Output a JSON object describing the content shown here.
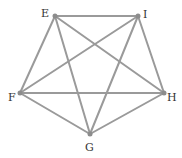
{
  "diagram": {
    "type": "complete-graph",
    "name": "K5",
    "colors": {
      "edge": "#9a9a9a",
      "vertex": "#8c8c8c",
      "label": "#333333",
      "background": "#ffffff"
    },
    "vertices": [
      {
        "id": "E",
        "label": "E",
        "x": 55,
        "y": 16,
        "lx": 41,
        "ly": 17
      },
      {
        "id": "I",
        "label": "I",
        "x": 138,
        "y": 16,
        "lx": 143,
        "ly": 18
      },
      {
        "id": "F",
        "label": "F",
        "x": 20,
        "y": 93,
        "lx": 8,
        "ly": 101
      },
      {
        "id": "H",
        "label": "H",
        "x": 164,
        "y": 93,
        "lx": 167,
        "ly": 101
      },
      {
        "id": "G",
        "label": "G",
        "x": 90,
        "y": 134,
        "lx": 85,
        "ly": 151
      }
    ],
    "edges": [
      [
        "E",
        "I"
      ],
      [
        "E",
        "F"
      ],
      [
        "E",
        "G"
      ],
      [
        "E",
        "H"
      ],
      [
        "I",
        "F"
      ],
      [
        "I",
        "G"
      ],
      [
        "I",
        "H"
      ],
      [
        "F",
        "H"
      ],
      [
        "F",
        "G"
      ],
      [
        "G",
        "H"
      ]
    ]
  }
}
